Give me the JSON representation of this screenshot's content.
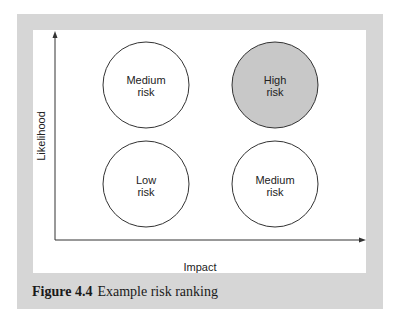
{
  "figure": {
    "number_label": "Figure 4.4",
    "caption": "Example risk ranking"
  },
  "axes": {
    "x_label": "Impact",
    "y_label": "Likelihood"
  },
  "cells": [
    {
      "position": "top-left",
      "line1": "Medium",
      "line2": "risk",
      "fill": "#ffffff"
    },
    {
      "position": "top-right",
      "line1": "High",
      "line2": "risk",
      "fill": "#c8c8c8"
    },
    {
      "position": "bottom-left",
      "line1": "Low",
      "line2": "risk",
      "fill": "#ffffff"
    },
    {
      "position": "bottom-right",
      "line1": "Medium",
      "line2": "risk",
      "fill": "#ffffff"
    }
  ],
  "colors": {
    "frame": "#d6d6d6",
    "high_risk": "#c8c8c8",
    "stroke": "#333333"
  }
}
